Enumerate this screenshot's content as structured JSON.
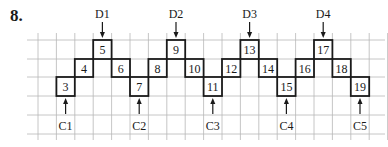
{
  "problem_number": "8.",
  "grid": {
    "origin_x": 38,
    "col_width": 18.4,
    "row_ys": [
      40,
      59,
      77,
      96,
      115,
      134
    ],
    "num_cols": 19,
    "color": "#b8b8b8"
  },
  "boxes": [
    {
      "label": "3",
      "col": 1,
      "row": 2
    },
    {
      "label": "4",
      "col": 2,
      "row": 1
    },
    {
      "label": "5",
      "col": 3,
      "row": 0
    },
    {
      "label": "6",
      "col": 4,
      "row": 1
    },
    {
      "label": "7",
      "col": 5,
      "row": 2
    },
    {
      "label": "8",
      "col": 6,
      "row": 1
    },
    {
      "label": "9",
      "col": 7,
      "row": 0
    },
    {
      "label": "10",
      "col": 8,
      "row": 1
    },
    {
      "label": "11",
      "col": 9,
      "row": 2
    },
    {
      "label": "12",
      "col": 10,
      "row": 1
    },
    {
      "label": "13",
      "col": 11,
      "row": 0
    },
    {
      "label": "14",
      "col": 12,
      "row": 1
    },
    {
      "label": "15",
      "col": 13,
      "row": 2
    },
    {
      "label": "16",
      "col": 14,
      "row": 1
    },
    {
      "label": "17",
      "col": 15,
      "row": 0
    },
    {
      "label": "18",
      "col": 16,
      "row": 1
    },
    {
      "label": "19",
      "col": 17,
      "row": 2
    }
  ],
  "top_labels": [
    {
      "label": "D1",
      "col": 3
    },
    {
      "label": "D2",
      "col": 7
    },
    {
      "label": "D3",
      "col": 11
    },
    {
      "label": "D4",
      "col": 15
    }
  ],
  "bottom_labels": [
    {
      "label": "C1",
      "col": 1
    },
    {
      "label": "C2",
      "col": 5
    },
    {
      "label": "C3",
      "col": 9
    },
    {
      "label": "C4",
      "col": 13
    },
    {
      "label": "C5",
      "col": 17
    }
  ]
}
